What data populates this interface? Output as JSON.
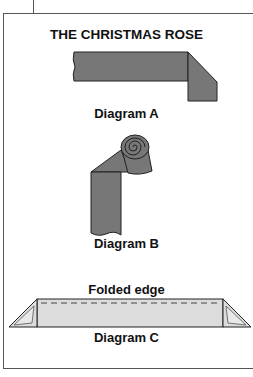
{
  "title": "THE CHRISTMAS ROSE",
  "diagrams": [
    {
      "id": "A",
      "label": "Diagram A"
    },
    {
      "id": "B",
      "label": "Diagram B"
    },
    {
      "id": "C",
      "label": "Diagram C",
      "annotation": "Folded edge"
    }
  ],
  "colors": {
    "ribbon": "#777777",
    "ribbon_light": "#dcdcdc",
    "outline": "#222222",
    "frame": "#555555"
  }
}
